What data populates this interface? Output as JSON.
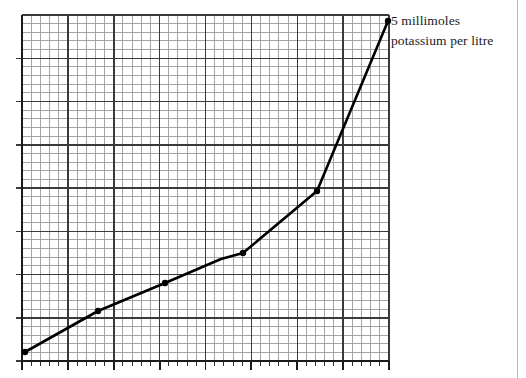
{
  "figure": {
    "annotation": {
      "line1": "5 millimoles",
      "line2": "potassium per litre"
    },
    "colors": {
      "minor_grid": "#9a9a9a",
      "major_grid": "#3a3a3a",
      "axis": "#1a1a1a",
      "curve": "#000000",
      "marker": "#000000",
      "page_border": "#b9b9b9",
      "background": "#ffffff",
      "text": "#1b1b1b"
    }
  },
  "chart_data": {
    "type": "line",
    "title": "",
    "subtitle": "",
    "xlabel": "",
    "ylabel": "",
    "annotations": [
      {
        "text": "5 millimoles potassium per litre",
        "target_point_index": 6,
        "position": "right-of-final-point"
      }
    ],
    "grid": {
      "minor_on": true,
      "major_on": true,
      "minor_cells_x": 40,
      "minor_cells_y": 40,
      "major_every_n_minor": 5,
      "plot_left_px": 22,
      "plot_right_px": 389,
      "plot_top_px": 15,
      "plot_bottom_px": 361
    },
    "axis": {
      "bottom_axis_visible": true,
      "left_axis_visible": true,
      "ticks_below_axis": true,
      "minor_tick_count": 40,
      "major_tick_count": 9,
      "tick_labels": []
    },
    "xlim": [
      0,
      40
    ],
    "ylim": [
      0,
      40
    ],
    "x": [
      0.3,
      8.3,
      16.6,
      24.0,
      24.8,
      32.1,
      39.8
    ],
    "y": [
      1.0,
      5.8,
      9.0,
      12.3,
      12.5,
      19.7,
      39.3
    ],
    "points_px": [
      {
        "x": 25,
        "y": 352
      },
      {
        "x": 98,
        "y": 311
      },
      {
        "x": 165,
        "y": 283
      },
      {
        "x": 221,
        "y": 259
      },
      {
        "x": 243,
        "y": 253
      },
      {
        "x": 317,
        "y": 191
      },
      {
        "x": 388,
        "y": 21
      }
    ],
    "markers": {
      "shape": "filled-circle",
      "visible_indices": [
        0,
        1,
        2,
        4,
        5,
        6
      ],
      "radius_px": 3.2
    },
    "series": [
      {
        "name": "potassium response curve",
        "values": [
          1.0,
          5.8,
          9.0,
          12.3,
          12.5,
          19.7,
          39.3
        ]
      }
    ],
    "legend": {
      "visible": false,
      "entries": [],
      "position": "none"
    }
  }
}
